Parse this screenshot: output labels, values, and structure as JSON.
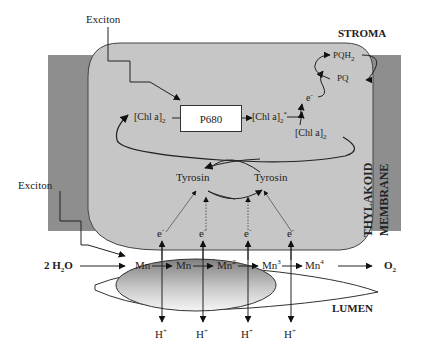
{
  "diagram": {
    "type": "photosystem-II-water-oxidation-schematic",
    "regions": {
      "stroma": "STROMA",
      "membrane_line1": "THYLAKOID",
      "membrane_line2": "MEMBRANE",
      "lumen": "LUMEN"
    },
    "exciton_top": "Exciton",
    "exciton_left": "Exciton",
    "reaction_center": "P680",
    "chl_left": "[Chl a]",
    "chl_left_sub": "2",
    "chl_excited": "[Chl a]",
    "chl_excited_sub": "2",
    "chl_excited_sup": "*",
    "chl_ground": "[Chl a]",
    "chl_ground_sub": "2",
    "electron_top": "e",
    "electron_sup": "-",
    "pqh2": "PQH",
    "pqh2_sub": "2",
    "pq": "PQ",
    "tyrosin_left": "Tyrosin",
    "tyrosin_right": "Tyrosin",
    "electrons": [
      {
        "label": "e",
        "sup": "-"
      },
      {
        "label": "e",
        "sup": "-"
      },
      {
        "label": "e",
        "sup": "-"
      },
      {
        "label": "e",
        "sup": "-"
      }
    ],
    "water": "2 H",
    "water_sub": "2",
    "water_end": "O",
    "oxygen": "O",
    "oxygen_sub": "2",
    "manganese_states": [
      {
        "label": "Mn",
        "sup": ""
      },
      {
        "label": "Mn",
        "sup": ""
      },
      {
        "label": "Mn",
        "sup": "2"
      },
      {
        "label": "Mn",
        "sup": "3"
      },
      {
        "label": "Mn",
        "sup": "4"
      }
    ],
    "protons": [
      {
        "label": "H",
        "sup": "+"
      },
      {
        "label": "H",
        "sup": "+"
      },
      {
        "label": "H",
        "sup": "+"
      },
      {
        "label": "H",
        "sup": "+"
      }
    ],
    "colors": {
      "membrane": "#8e8e8e",
      "stroma_box": "#c6c6c6",
      "mn_cluster_dark": "#8a8a8a",
      "mn_cluster_light": "#f4f4f4",
      "line": "#222222"
    }
  }
}
